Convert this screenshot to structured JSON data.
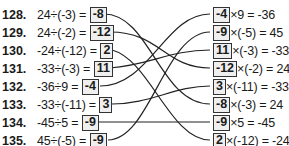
{
  "left": [
    {
      "num": "128.",
      "expr": "24÷(-3) =",
      "answer": "-8"
    },
    {
      "num": "129.",
      "expr": "24÷(-2) =",
      "answer": "-12"
    },
    {
      "num": "130.",
      "expr": "-24÷(-12) =",
      "answer": "2"
    },
    {
      "num": "131.",
      "expr": "-33÷(-3) =",
      "answer": "11"
    },
    {
      "num": "132.",
      "expr": "-36÷9 =",
      "answer": "-4"
    },
    {
      "num": "133.",
      "expr": "-33÷(-11) =",
      "answer": "3"
    },
    {
      "num": "134.",
      "expr": "-45÷5 =",
      "answer": "-9"
    },
    {
      "num": "135.",
      "expr": "45÷(-5) =",
      "answer": "-9"
    }
  ],
  "right": [
    {
      "value": "-4",
      "expr": "×9 = -36"
    },
    {
      "value": "-9",
      "expr": "×(-5) = 45"
    },
    {
      "value": "11",
      "expr": "×(-3) = -33"
    },
    {
      "value": "-12",
      "expr": "×(-2) = 24"
    },
    {
      "value": "3",
      "expr": "×(-11) = -33"
    },
    {
      "value": "-8",
      "expr": "×(-3) = 24"
    },
    {
      "value": "-9",
      "expr": "×5 = -45"
    },
    {
      "value": "2",
      "expr": "×(-12) = -24"
    }
  ],
  "connections": [
    {
      "from": 0,
      "to": 5
    },
    {
      "from": 1,
      "to": 3
    },
    {
      "from": 2,
      "to": 7
    },
    {
      "from": 3,
      "to": 2
    },
    {
      "from": 4,
      "to": 0
    },
    {
      "from": 5,
      "to": 4
    },
    {
      "from": 6,
      "to": 6
    },
    {
      "from": 7,
      "to": 1
    }
  ]
}
